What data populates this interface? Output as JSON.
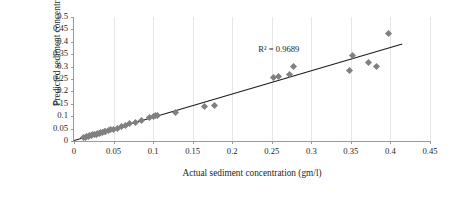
{
  "chart_data": {
    "type": "scatter",
    "title": "",
    "xlabel": "Actual sediment concentration (gm/l)",
    "ylabel": "Predicted sediment concentration (gm/l)",
    "xlim": [
      0,
      0.45
    ],
    "ylim": [
      0,
      0.5
    ],
    "xticks": [
      "0",
      "0.05",
      "0.1",
      "0.15",
      "0.2",
      "0.25",
      "0.3",
      "0.35",
      "0.4",
      "0.45"
    ],
    "xtick_values": [
      0,
      0.05,
      0.1,
      0.15,
      0.2,
      0.25,
      0.3,
      0.35,
      0.4,
      0.45
    ],
    "yticks": [
      "0",
      "0.05",
      "0.1",
      "0.15",
      "0.2",
      "0.25",
      "0.3",
      "0.35",
      "0.4",
      "0.45",
      "0.5"
    ],
    "ytick_values": [
      0,
      0.05,
      0.1,
      0.15,
      0.2,
      0.25,
      0.3,
      0.35,
      0.4,
      0.45,
      0.5
    ],
    "grid": "vertical",
    "legend": "none",
    "marker_color": "#808080",
    "marker_shape": "diamond",
    "trendline_color": "#1a1a1a",
    "annotations": [
      {
        "text": "R² = 0.9689",
        "x": 0.233,
        "y": 0.368
      }
    ],
    "trendline": {
      "x0": 0.0,
      "y0": 0.003,
      "x1": 0.415,
      "y1": 0.392
    },
    "points": [
      {
        "x": 0.012,
        "y": 0.014
      },
      {
        "x": 0.014,
        "y": 0.016
      },
      {
        "x": 0.016,
        "y": 0.017
      },
      {
        "x": 0.018,
        "y": 0.019
      },
      {
        "x": 0.02,
        "y": 0.021
      },
      {
        "x": 0.022,
        "y": 0.023
      },
      {
        "x": 0.024,
        "y": 0.025
      },
      {
        "x": 0.026,
        "y": 0.026
      },
      {
        "x": 0.028,
        "y": 0.028
      },
      {
        "x": 0.03,
        "y": 0.03
      },
      {
        "x": 0.032,
        "y": 0.032
      },
      {
        "x": 0.034,
        "y": 0.034
      },
      {
        "x": 0.036,
        "y": 0.036
      },
      {
        "x": 0.038,
        "y": 0.038
      },
      {
        "x": 0.04,
        "y": 0.04
      },
      {
        "x": 0.043,
        "y": 0.042
      },
      {
        "x": 0.046,
        "y": 0.045
      },
      {
        "x": 0.05,
        "y": 0.048
      },
      {
        "x": 0.055,
        "y": 0.052
      },
      {
        "x": 0.06,
        "y": 0.058
      },
      {
        "x": 0.065,
        "y": 0.062
      },
      {
        "x": 0.07,
        "y": 0.07
      },
      {
        "x": 0.078,
        "y": 0.076
      },
      {
        "x": 0.085,
        "y": 0.082
      },
      {
        "x": 0.095,
        "y": 0.093
      },
      {
        "x": 0.1,
        "y": 0.1
      },
      {
        "x": 0.103,
        "y": 0.102
      },
      {
        "x": 0.106,
        "y": 0.104
      },
      {
        "x": 0.128,
        "y": 0.113
      },
      {
        "x": 0.165,
        "y": 0.14
      },
      {
        "x": 0.178,
        "y": 0.142
      },
      {
        "x": 0.252,
        "y": 0.258
      },
      {
        "x": 0.258,
        "y": 0.262
      },
      {
        "x": 0.272,
        "y": 0.268
      },
      {
        "x": 0.278,
        "y": 0.3
      },
      {
        "x": 0.348,
        "y": 0.283
      },
      {
        "x": 0.352,
        "y": 0.345
      },
      {
        "x": 0.372,
        "y": 0.315
      },
      {
        "x": 0.382,
        "y": 0.3
      },
      {
        "x": 0.398,
        "y": 0.432
      }
    ]
  }
}
